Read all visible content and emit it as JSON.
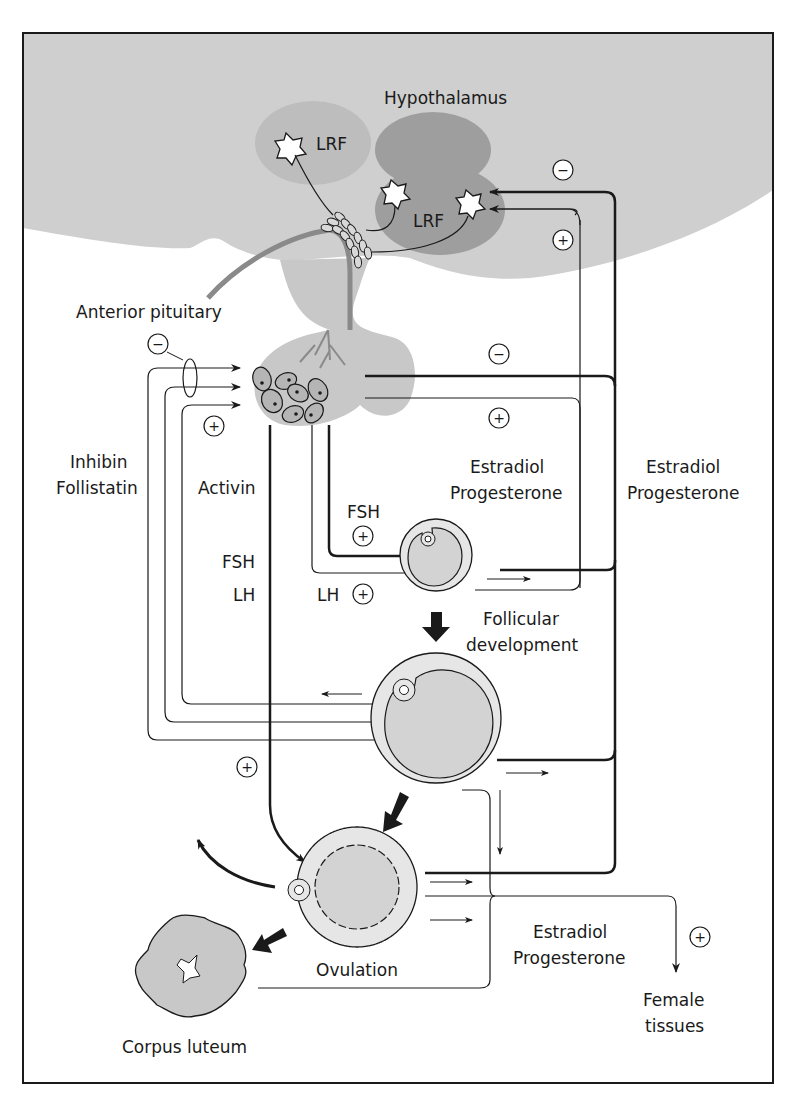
{
  "diagram": {
    "colors": {
      "background": "#ffffff",
      "brain_gray": "#cfcfcf",
      "nucleus_light": "#bdbdbd",
      "nucleus_dark": "#9e9e9e",
      "pituitary": "#c8c8c8",
      "follicle_fill": "#d3d3d3",
      "follicle_ring": "#e6e6e6",
      "stroke": "#1a1a1a",
      "portal_vessel": "#8a8a8a"
    },
    "labels": {
      "hypothalamus": "Hypothalamus",
      "lrf_left": "LRF",
      "lrf_right": "LRF",
      "anterior_pituitary": "Anterior pituitary",
      "inhibin": "Inhibin",
      "follistatin": "Follistatin",
      "activin": "Activin",
      "fsh_left": "FSH",
      "lh_left": "LH",
      "fsh_mid": "FSH",
      "lh_mid": "LH",
      "estradiol_mid": "Estradiol",
      "progesterone_mid": "Progesterone",
      "estradiol_right": "Estradiol",
      "progesterone_right": "Progesterone",
      "follicular": "Follicular",
      "development": "development",
      "ovulation": "Ovulation",
      "corpus_luteum": "Corpus luteum",
      "estradiol_bottom": "Estradiol",
      "progesterone_bottom": "Progesterone",
      "female": "Female",
      "tissues": "tissues"
    },
    "signs": {
      "minus": "−",
      "plus": "+"
    },
    "feedback_signs": [
      {
        "id": "hypothalamus-negative",
        "sign": "−"
      },
      {
        "id": "hypothalamus-positive",
        "sign": "+"
      },
      {
        "id": "pituitary-inhibin-negative",
        "sign": "−"
      },
      {
        "id": "pituitary-activin-positive",
        "sign": "+"
      },
      {
        "id": "pituitary-steroid-negative",
        "sign": "−"
      },
      {
        "id": "pituitary-steroid-positive",
        "sign": "+"
      },
      {
        "id": "fsh-positive",
        "sign": "+"
      },
      {
        "id": "lh-positive",
        "sign": "+"
      },
      {
        "id": "ovulation-lh-surge-positive",
        "sign": "+"
      },
      {
        "id": "female-tissues-positive",
        "sign": "+"
      }
    ]
  }
}
